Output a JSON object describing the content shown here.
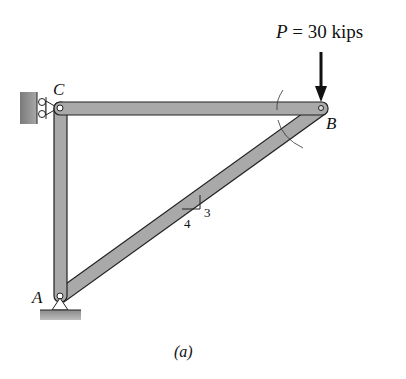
{
  "figure": {
    "caption": "(a)",
    "load": {
      "symbol": "P",
      "equals": " = 30 kips",
      "value": 30,
      "unit": "kips"
    },
    "joints": [
      {
        "name": "A",
        "label": "A",
        "support": "pin"
      },
      {
        "name": "B",
        "label": "B",
        "support": "none"
      },
      {
        "name": "C",
        "label": "C",
        "support": "roller-wall"
      }
    ],
    "members": [
      "AC",
      "CB",
      "AB"
    ],
    "slope": {
      "rise": "3",
      "run": "4"
    },
    "colors": {
      "member": "#a9a9a9",
      "outline": "#222222",
      "wall": "#8c8c8c"
    }
  }
}
